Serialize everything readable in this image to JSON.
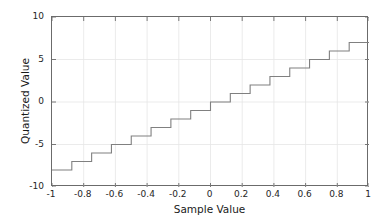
{
  "figure": {
    "background_color": "#ffffff",
    "axes_color": "#6b6b6b",
    "grid_color": "#e6e6e6",
    "line_color": "#808080",
    "tick_label_color": "#262626",
    "title_color": "#1a1a1a"
  },
  "chart_data": {
    "type": "line",
    "title": "",
    "subtitle": "",
    "xlabel": "Sample Value",
    "ylabel": "Quantized Value",
    "xlim": [
      -1,
      1
    ],
    "ylim": [
      -10,
      10
    ],
    "grid": true,
    "legend": null,
    "legend_position": "none",
    "xticks": [
      -1,
      -0.8,
      -0.6,
      -0.4,
      -0.2,
      0,
      0.2,
      0.4,
      0.6,
      0.8,
      1
    ],
    "xticklabels": [
      "-1",
      "-0.8",
      "-0.6",
      "-0.4",
      "-0.2",
      "0",
      "0.2",
      "0.4",
      "0.6",
      "0.8",
      "1"
    ],
    "yticks": [
      -10,
      -5,
      0,
      5,
      10
    ],
    "yticklabels": [
      "-10",
      "-5",
      "0",
      "5",
      "10"
    ],
    "drawstyle": "steps-post",
    "series": [
      {
        "name": "Quantizer transfer curve",
        "color": "#808080",
        "linewidth": 1.1,
        "step_edges": [
          -1.0,
          -0.875,
          -0.75,
          -0.625,
          -0.5,
          -0.375,
          -0.25,
          -0.125,
          0.0,
          0.125,
          0.25,
          0.375,
          0.5,
          0.625,
          0.75,
          0.875,
          1.0
        ],
        "step_values": [
          -8,
          -7,
          -6,
          -5,
          -4,
          -3,
          -2,
          -1,
          0,
          1,
          2,
          3,
          4,
          5,
          6,
          7
        ]
      }
    ]
  }
}
